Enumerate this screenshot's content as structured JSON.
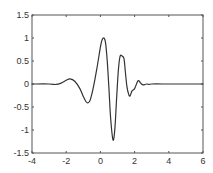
{
  "chart_data": {
    "type": "line",
    "title": "",
    "xlabel": "",
    "ylabel": "",
    "xlim": [
      -4,
      6
    ],
    "ylim": [
      -1.5,
      1.5
    ],
    "grid": false,
    "legend": null,
    "x_ticks": [
      -4,
      -2,
      0,
      2,
      4,
      6
    ],
    "x_tick_labels": [
      "-4",
      "-2",
      "0",
      "2",
      "4",
      "6"
    ],
    "y_ticks": [
      1.5,
      1,
      0.5,
      0,
      -0.5,
      -1,
      -1.5
    ],
    "y_tick_labels": [
      "1.5",
      "1",
      "0.5",
      "0",
      "-0.5",
      "-1",
      "-1.5"
    ],
    "series": [
      {
        "name": "wavelet",
        "color": "#333333",
        "x": [
          -4.0,
          -3.0,
          -2.6,
          -2.3,
          -2.0,
          -1.78,
          -1.5,
          -1.2,
          -1.0,
          -0.85,
          -0.73,
          -0.6,
          -0.4,
          -0.2,
          0.0,
          0.1,
          0.21,
          0.3,
          0.4,
          0.5,
          0.6,
          0.74,
          0.85,
          0.95,
          1.05,
          1.15,
          1.26,
          1.38,
          1.45,
          1.55,
          1.65,
          1.73,
          1.85,
          2.0,
          2.2,
          2.35,
          2.5,
          2.7,
          2.85,
          3.0,
          4.0,
          5.0,
          6.0
        ],
        "y": [
          0.0,
          0.0,
          -0.01,
          0.02,
          0.08,
          0.11,
          0.06,
          -0.1,
          -0.27,
          -0.38,
          -0.41,
          -0.35,
          -0.05,
          0.35,
          0.8,
          0.96,
          1.0,
          0.9,
          0.5,
          -0.1,
          -0.75,
          -1.22,
          -0.95,
          -0.3,
          0.3,
          0.6,
          0.61,
          0.55,
          0.3,
          -0.05,
          -0.22,
          -0.26,
          -0.15,
          -0.1,
          0.07,
          0.02,
          -0.02,
          0.0,
          -0.01,
          0.0,
          0.0,
          0.0,
          0.0
        ]
      }
    ]
  },
  "plot_area": {
    "left": 32,
    "right": 203,
    "top": 15,
    "bottom": 153
  },
  "colors": {
    "axes": "#555555",
    "line": "#333333",
    "text": "#333333",
    "background": "#ffffff"
  }
}
